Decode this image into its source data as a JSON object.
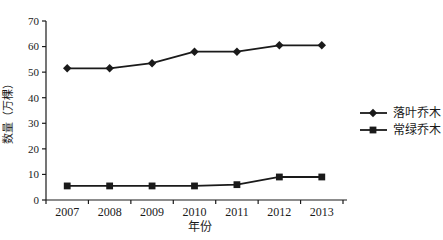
{
  "chart_data": {
    "type": "line",
    "title": "",
    "categories": [
      "2007",
      "2008",
      "2009",
      "2010",
      "2011",
      "2012",
      "2013"
    ],
    "series": [
      {
        "name": "落叶乔木",
        "marker": "diamond",
        "values": [
          51.5,
          51.5,
          53.5,
          58,
          58,
          60.5,
          60.5
        ]
      },
      {
        "name": "常绿乔木",
        "marker": "square",
        "values": [
          5.5,
          5.5,
          5.5,
          5.5,
          6,
          9,
          9
        ]
      }
    ],
    "xlabel": "年份",
    "ylabel": "数量（万棵）",
    "ylim": [
      0,
      70
    ],
    "ytick_step": 10,
    "yticks": [
      0,
      10,
      20,
      30,
      40,
      50,
      60,
      70
    ],
    "grid": false,
    "legend_position": "right",
    "line_color": "#1a1a1a",
    "background": "#ffffff"
  }
}
